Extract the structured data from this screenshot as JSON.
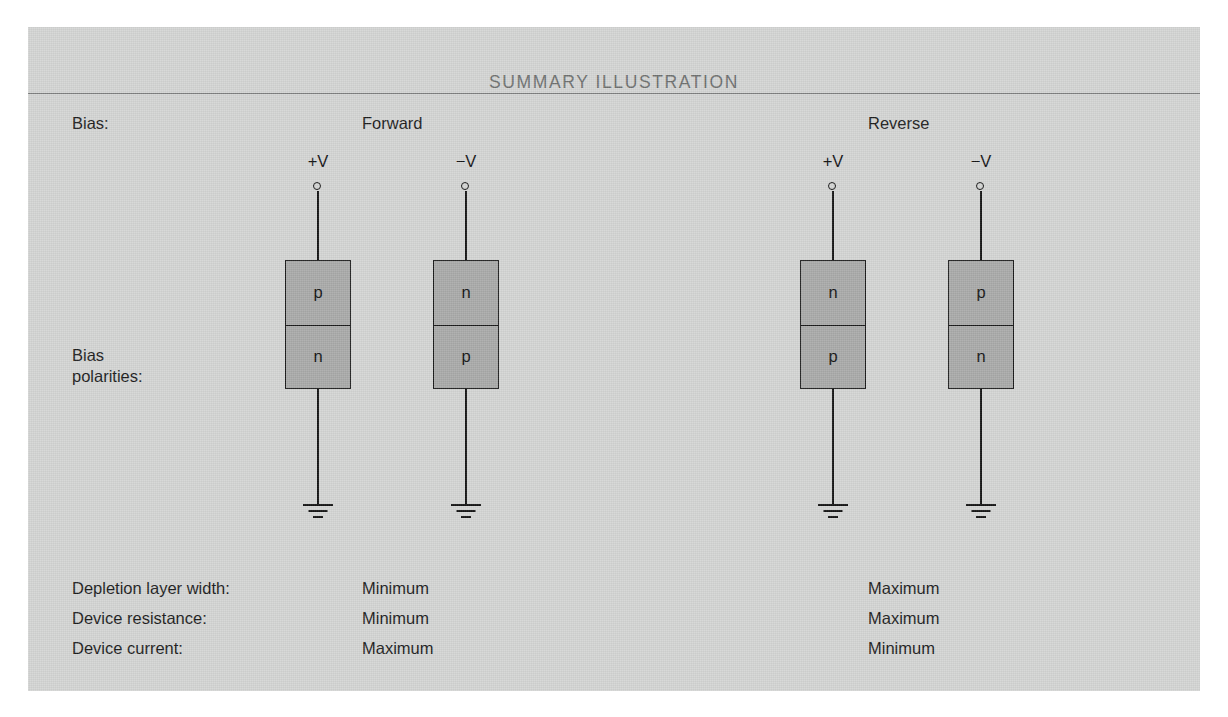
{
  "figure": {
    "title": "SUMMARY ILLUSTRATION"
  },
  "rows": {
    "bias_label": "Bias:",
    "polarity_label_line1": "Bias",
    "polarity_label_line2": "polarities:"
  },
  "columns": [
    {
      "name": "forward",
      "label": "Forward"
    },
    {
      "name": "reverse",
      "label": "Reverse"
    }
  ],
  "circuits": [
    {
      "column": "forward",
      "supply": "+V",
      "top_region": "p",
      "bottom_region": "n",
      "ground": "ground-symbol"
    },
    {
      "column": "forward",
      "supply": "−V",
      "top_region": "n",
      "bottom_region": "p",
      "ground": "ground-symbol"
    },
    {
      "column": "reverse",
      "supply": "+V",
      "top_region": "n",
      "bottom_region": "p",
      "ground": "ground-symbol"
    },
    {
      "column": "reverse",
      "supply": "−V",
      "top_region": "p",
      "bottom_region": "n",
      "ground": "ground-symbol"
    }
  ],
  "summary": [
    {
      "label": "Depletion layer width:",
      "forward": "Minimum",
      "reverse": "Maximum"
    },
    {
      "label": "Device resistance:",
      "forward": "Minimum",
      "reverse": "Maximum"
    },
    {
      "label": "Device current:",
      "forward": "Maximum",
      "reverse": "Minimum"
    }
  ],
  "colors": {
    "panel_background": "#d4d5d4",
    "semiconductor_fill": "#a9aaa9",
    "ink": "#141414",
    "title_text": "#6f7170",
    "divider": "#7e807f",
    "page_background": "#ffffff"
  }
}
